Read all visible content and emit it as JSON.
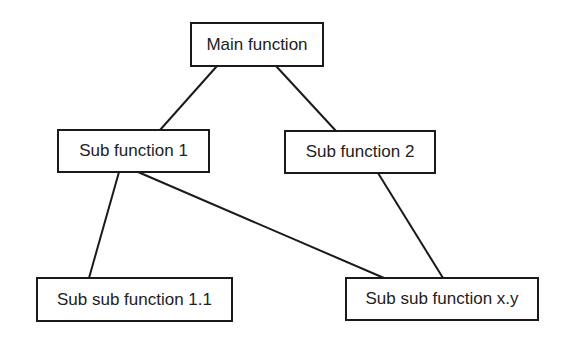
{
  "diagram": {
    "type": "hierarchy",
    "nodes": [
      {
        "id": "main",
        "label": "Main function",
        "x": 190,
        "y": 22,
        "w": 134,
        "h": 45
      },
      {
        "id": "sub1",
        "label": "Sub function 1",
        "x": 57,
        "y": 129,
        "w": 153,
        "h": 44
      },
      {
        "id": "sub2",
        "label": "Sub function 2",
        "x": 284,
        "y": 130,
        "w": 152,
        "h": 44
      },
      {
        "id": "sub11",
        "label": "Sub sub function 1.1",
        "x": 36,
        "y": 277,
        "w": 197,
        "h": 45
      },
      {
        "id": "subxy",
        "label": "Sub sub function x.y",
        "x": 345,
        "y": 277,
        "w": 194,
        "h": 44
      }
    ],
    "edges": [
      {
        "from": "main",
        "to": "sub1",
        "x1": 217,
        "y1": 66,
        "x2": 160,
        "y2": 130
      },
      {
        "from": "main",
        "to": "sub2",
        "x1": 276,
        "y1": 66,
        "x2": 336,
        "y2": 131
      },
      {
        "from": "sub1",
        "to": "sub11",
        "x1": 119,
        "y1": 172,
        "x2": 89,
        "y2": 278
      },
      {
        "from": "sub1",
        "to": "subxy",
        "x1": 138,
        "y1": 172,
        "x2": 384,
        "y2": 278
      },
      {
        "from": "sub2",
        "to": "subxy",
        "x1": 378,
        "y1": 173,
        "x2": 443,
        "y2": 278
      }
    ]
  }
}
